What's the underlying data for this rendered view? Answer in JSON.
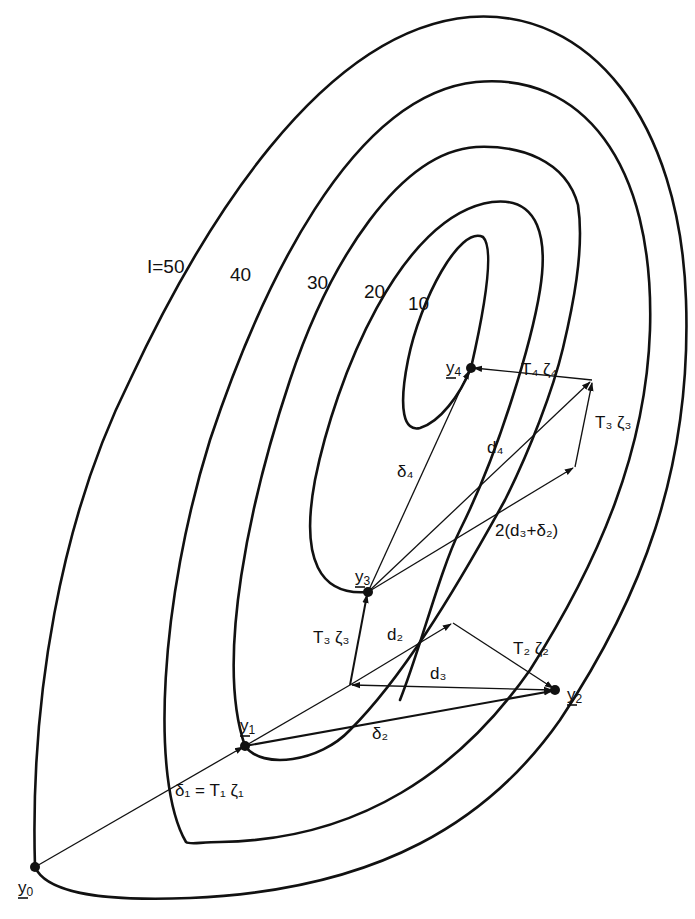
{
  "figure": {
    "contour_labels": [
      {
        "id": "c50",
        "text": "I=50",
        "x": 147,
        "y": 273
      },
      {
        "id": "c40",
        "text": "40",
        "x": 230,
        "y": 281
      },
      {
        "id": "c30",
        "text": "30",
        "x": 307,
        "y": 289
      },
      {
        "id": "c20",
        "text": "20",
        "x": 364,
        "y": 298
      },
      {
        "id": "c10",
        "text": "10",
        "x": 408,
        "y": 310
      }
    ],
    "points": [
      {
        "id": "y0",
        "main": "y",
        "sub": "0",
        "x": 35,
        "y": 867,
        "lx": 18,
        "ly": 893
      },
      {
        "id": "y1",
        "main": "y",
        "sub": "1",
        "x": 245,
        "y": 746,
        "lx": 240,
        "ly": 731
      },
      {
        "id": "y2",
        "main": "y",
        "sub": "2",
        "x": 555,
        "y": 690,
        "lx": 567,
        "ly": 700
      },
      {
        "id": "y3",
        "main": "y",
        "sub": "3",
        "x": 368,
        "y": 592,
        "lx": 355,
        "ly": 582
      },
      {
        "id": "y4",
        "main": "y",
        "sub": "4",
        "x": 471,
        "y": 368,
        "lx": 446,
        "ly": 373
      }
    ],
    "vector_labels": [
      {
        "id": "delta1",
        "text": "δ₁ = T₁ ζ₁",
        "x": 175,
        "y": 796
      },
      {
        "id": "delta2",
        "text": "δ₂",
        "x": 372,
        "y": 739
      },
      {
        "id": "d2",
        "text": "d₂",
        "x": 387,
        "y": 640
      },
      {
        "id": "d3",
        "text": "d₃",
        "x": 430,
        "y": 679
      },
      {
        "id": "T2zeta2",
        "text": "T₂ ζ₂",
        "x": 513,
        "y": 654
      },
      {
        "id": "T3zeta3_lower",
        "text": "T₃ ζ₃",
        "x": 313,
        "y": 643
      },
      {
        "id": "T3zeta3_upper",
        "text": "T₃ ζ₃",
        "x": 595,
        "y": 428
      },
      {
        "id": "T4zeta4",
        "text": "T₄ ζ₄",
        "x": 521,
        "y": 375
      },
      {
        "id": "delta4",
        "text": "δ₄",
        "x": 397,
        "y": 477
      },
      {
        "id": "d4",
        "text": "d₄",
        "x": 487,
        "y": 453
      },
      {
        "id": "combo",
        "text": "2(d₃+δ₂)",
        "x": 495,
        "y": 536
      }
    ]
  }
}
